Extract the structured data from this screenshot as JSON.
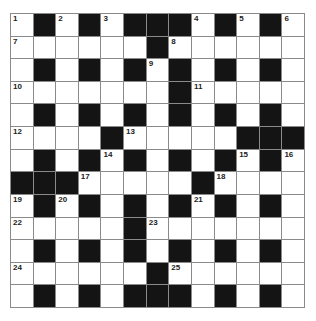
{
  "puzzle": {
    "size": 13,
    "colors": {
      "black": "#141414",
      "white": "#ffffff",
      "grid_line": "#8a8a8a"
    },
    "rows": [
      "W#W#W###W#W#W",
      "WWWWWW#WWWWWW",
      "W#W#W#W#W#W#W",
      "WWWWWWW#WWWWW",
      "W#W#W#W#W#W#W",
      "WWWW#WWWWW###",
      "W#W#W#W#W#W#W",
      "###WWWWW#WWWW",
      "W#W#W#W#W#W#W",
      "WWWWW#WWWWWWW",
      "W#W#W#W#W#W#W",
      "WWWWWW#WWWWWW",
      "W#W#W###W#W#W"
    ],
    "numbers": [
      {
        "n": "1",
        "r": 0,
        "c": 0
      },
      {
        "n": "2",
        "r": 0,
        "c": 2
      },
      {
        "n": "3",
        "r": 0,
        "c": 4
      },
      {
        "n": "4",
        "r": 0,
        "c": 8
      },
      {
        "n": "5",
        "r": 0,
        "c": 10
      },
      {
        "n": "6",
        "r": 0,
        "c": 12
      },
      {
        "n": "7",
        "r": 1,
        "c": 0
      },
      {
        "n": "8",
        "r": 1,
        "c": 7
      },
      {
        "n": "9",
        "r": 2,
        "c": 6
      },
      {
        "n": "10",
        "r": 3,
        "c": 0
      },
      {
        "n": "11",
        "r": 3,
        "c": 8
      },
      {
        "n": "12",
        "r": 5,
        "c": 0
      },
      {
        "n": "13",
        "r": 5,
        "c": 5
      },
      {
        "n": "14",
        "r": 6,
        "c": 4
      },
      {
        "n": "15",
        "r": 6,
        "c": 10
      },
      {
        "n": "16",
        "r": 6,
        "c": 12
      },
      {
        "n": "17",
        "r": 7,
        "c": 3
      },
      {
        "n": "18",
        "r": 7,
        "c": 9
      },
      {
        "n": "19",
        "r": 8,
        "c": 0
      },
      {
        "n": "20",
        "r": 8,
        "c": 2
      },
      {
        "n": "21",
        "r": 8,
        "c": 8
      },
      {
        "n": "22",
        "r": 9,
        "c": 0
      },
      {
        "n": "23",
        "r": 9,
        "c": 6
      },
      {
        "n": "24",
        "r": 11,
        "c": 0
      },
      {
        "n": "25",
        "r": 11,
        "c": 7
      }
    ]
  }
}
